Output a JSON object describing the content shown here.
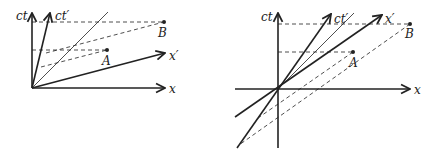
{
  "left_diagram": {
    "axes": {
      "ct": "ct",
      "x": "x",
      "ct_prime": "ct′",
      "x_prime": "x′"
    },
    "points": {
      "A": "A",
      "B": "B"
    }
  },
  "right_diagram": {
    "axes": {
      "ct": "ct",
      "x": "x",
      "ct_prime": "ct′",
      "x_prime": "x′"
    },
    "points": {
      "A": "A",
      "B": "B"
    }
  },
  "colors": {
    "line": "#222222",
    "background": "#ffffff"
  }
}
